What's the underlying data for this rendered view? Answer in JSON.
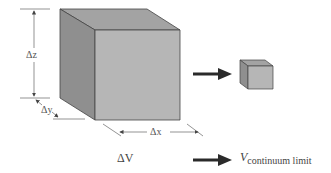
{
  "diagram": {
    "dimension_labels": {
      "dz": "Δz",
      "dy": "Δy",
      "dx": "Δx"
    },
    "volume_label": "ΔV",
    "limit_label": {
      "symbol": "V",
      "subscript": "continuum limit"
    },
    "colors": {
      "cube_front": "#b4b4b4",
      "cube_side": "#8c8c8c",
      "cube_top": "#a0a0a0",
      "arrow": "#2a2a2a",
      "dim_line": "#555555"
    }
  }
}
